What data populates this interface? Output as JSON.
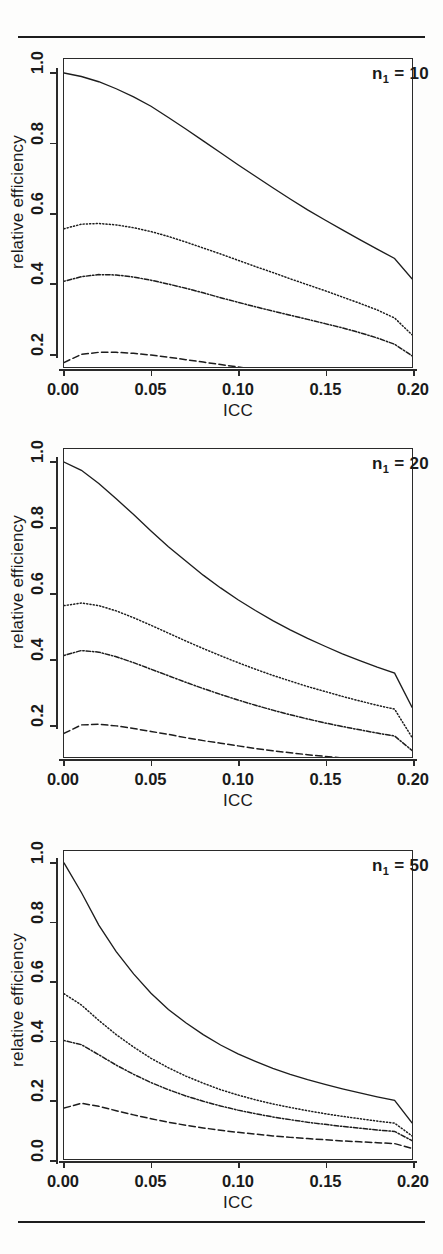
{
  "figure": {
    "background_color": "#fdfdfc",
    "ink_color": "#1d1d1d",
    "top_rule": true,
    "bottom_rule": true
  },
  "chart_data": [
    {
      "type": "line",
      "title": "",
      "panel_label": "n",
      "panel_label_sub": "1",
      "panel_label_value": "= 10",
      "xlabel": "ICC",
      "ylabel": "relative efficiency",
      "xlim": [
        0.0,
        0.2
      ],
      "ylim": [
        0.16,
        1.04
      ],
      "xticks": [
        0.0,
        0.05,
        0.1,
        0.15,
        0.2
      ],
      "xtick_labels": [
        "0.00",
        "0.05",
        "0.10",
        "0.15",
        "0.20"
      ],
      "yticks": [
        0.2,
        0.4,
        0.6,
        0.8,
        1.0
      ],
      "ytick_labels": [
        "0.2",
        "0.4",
        "0.6",
        "0.8",
        "1.0"
      ],
      "grid": false,
      "legend": "none",
      "x": [
        0.0,
        0.01,
        0.02,
        0.03,
        0.04,
        0.05,
        0.06,
        0.07,
        0.08,
        0.09,
        0.1,
        0.11,
        0.12,
        0.13,
        0.14,
        0.15,
        0.16,
        0.17,
        0.18,
        0.19,
        0.2
      ],
      "series": [
        {
          "name": "series-1",
          "style": "solid",
          "values": [
            1.0,
            0.99,
            0.975,
            0.955,
            0.932,
            0.905,
            0.873,
            0.84,
            0.806,
            0.772,
            0.738,
            0.705,
            0.672,
            0.64,
            0.609,
            0.58,
            0.552,
            0.524,
            0.497,
            0.47,
            0.412
          ]
        },
        {
          "name": "series-2",
          "style": "dotted",
          "values": [
            0.555,
            0.568,
            0.57,
            0.566,
            0.558,
            0.547,
            0.533,
            0.517,
            0.5,
            0.483,
            0.465,
            0.447,
            0.43,
            0.412,
            0.395,
            0.378,
            0.36,
            0.342,
            0.323,
            0.3,
            0.252
          ]
        },
        {
          "name": "series-3",
          "style": "dotdash",
          "values": [
            0.405,
            0.418,
            0.424,
            0.423,
            0.417,
            0.408,
            0.397,
            0.385,
            0.372,
            0.358,
            0.345,
            0.332,
            0.32,
            0.308,
            0.296,
            0.284,
            0.272,
            0.258,
            0.243,
            0.225,
            0.192
          ]
        },
        {
          "name": "series-4",
          "style": "dashed",
          "values": [
            0.173,
            0.196,
            0.202,
            0.202,
            0.199,
            0.194,
            0.188,
            0.181,
            0.174,
            0.167,
            0.16,
            0.153,
            0.147,
            0.141,
            0.135,
            0.129,
            0.124,
            0.118,
            0.112,
            0.105,
            0.091
          ]
        }
      ]
    },
    {
      "type": "line",
      "title": "",
      "panel_label": "n",
      "panel_label_sub": "1",
      "panel_label_value": "= 20",
      "xlabel": "ICC",
      "ylabel": "relative efficiency",
      "xlim": [
        0.0,
        0.2
      ],
      "ylim": [
        0.1,
        1.04
      ],
      "xticks": [
        0.0,
        0.05,
        0.1,
        0.15,
        0.2
      ],
      "xtick_labels": [
        "0.00",
        "0.05",
        "0.10",
        "0.15",
        "0.20"
      ],
      "yticks": [
        0.2,
        0.4,
        0.6,
        0.8,
        1.0
      ],
      "ytick_labels": [
        "0.2",
        "0.4",
        "0.6",
        "0.8",
        "1.0"
      ],
      "grid": false,
      "legend": "none",
      "x": [
        0.0,
        0.01,
        0.02,
        0.03,
        0.04,
        0.05,
        0.06,
        0.07,
        0.08,
        0.09,
        0.1,
        0.11,
        0.12,
        0.13,
        0.14,
        0.15,
        0.16,
        0.17,
        0.18,
        0.19,
        0.2
      ],
      "series": [
        {
          "name": "series-1",
          "style": "solid",
          "values": [
            1.0,
            0.975,
            0.935,
            0.888,
            0.84,
            0.79,
            0.742,
            0.698,
            0.655,
            0.616,
            0.58,
            0.547,
            0.516,
            0.488,
            0.462,
            0.438,
            0.415,
            0.394,
            0.374,
            0.356,
            0.252
          ]
        },
        {
          "name": "series-2",
          "style": "dotted",
          "values": [
            0.562,
            0.57,
            0.562,
            0.546,
            0.525,
            0.502,
            0.478,
            0.454,
            0.431,
            0.409,
            0.388,
            0.368,
            0.349,
            0.332,
            0.315,
            0.3,
            0.285,
            0.271,
            0.258,
            0.246,
            0.16
          ]
        },
        {
          "name": "series-3",
          "style": "dotdash",
          "values": [
            0.41,
            0.425,
            0.42,
            0.406,
            0.388,
            0.368,
            0.348,
            0.328,
            0.309,
            0.291,
            0.274,
            0.258,
            0.243,
            0.229,
            0.216,
            0.204,
            0.193,
            0.183,
            0.173,
            0.164,
            0.12
          ]
        },
        {
          "name": "series-4",
          "style": "dashed",
          "values": [
            0.172,
            0.198,
            0.2,
            0.195,
            0.187,
            0.178,
            0.169,
            0.159,
            0.15,
            0.142,
            0.134,
            0.126,
            0.119,
            0.113,
            0.107,
            0.102,
            0.097,
            0.092,
            0.088,
            0.084,
            0.065
          ]
        }
      ]
    },
    {
      "type": "line",
      "title": "",
      "panel_label": "n",
      "panel_label_sub": "1",
      "panel_label_value": "= 50",
      "xlabel": "ICC",
      "ylabel": "relative efficiency",
      "xlim": [
        0.0,
        0.2
      ],
      "ylim": [
        0.0,
        1.04
      ],
      "xticks": [
        0.0,
        0.05,
        0.1,
        0.15,
        0.2
      ],
      "xtick_labels": [
        "0.00",
        "0.05",
        "0.10",
        "0.15",
        "0.20"
      ],
      "yticks": [
        0.0,
        0.2,
        0.4,
        0.6,
        0.8,
        1.0
      ],
      "ytick_labels": [
        "0.0",
        "0.2",
        "0.4",
        "0.6",
        "0.8",
        "1.0"
      ],
      "grid": false,
      "legend": "none",
      "x": [
        0.0,
        0.01,
        0.02,
        0.03,
        0.04,
        0.05,
        0.06,
        0.07,
        0.08,
        0.09,
        0.1,
        0.11,
        0.12,
        0.13,
        0.14,
        0.15,
        0.16,
        0.17,
        0.18,
        0.19,
        0.2
      ],
      "series": [
        {
          "name": "series-1",
          "style": "solid",
          "values": [
            1.0,
            0.9,
            0.79,
            0.7,
            0.625,
            0.56,
            0.505,
            0.46,
            0.42,
            0.385,
            0.355,
            0.33,
            0.306,
            0.286,
            0.268,
            0.252,
            0.237,
            0.223,
            0.21,
            0.198,
            0.122
          ]
        },
        {
          "name": "series-2",
          "style": "dotted",
          "values": [
            0.558,
            0.52,
            0.468,
            0.42,
            0.378,
            0.34,
            0.308,
            0.28,
            0.256,
            0.234,
            0.216,
            0.2,
            0.186,
            0.174,
            0.163,
            0.153,
            0.144,
            0.136,
            0.128,
            0.121,
            0.078
          ]
        },
        {
          "name": "series-3",
          "style": "dotdash",
          "values": [
            0.4,
            0.386,
            0.352,
            0.317,
            0.286,
            0.258,
            0.234,
            0.213,
            0.195,
            0.179,
            0.165,
            0.153,
            0.142,
            0.133,
            0.124,
            0.117,
            0.11,
            0.104,
            0.098,
            0.093,
            0.062
          ]
        },
        {
          "name": "series-4",
          "style": "dashed",
          "values": [
            0.172,
            0.188,
            0.178,
            0.163,
            0.149,
            0.136,
            0.124,
            0.114,
            0.105,
            0.097,
            0.09,
            0.084,
            0.078,
            0.073,
            0.069,
            0.065,
            0.061,
            0.058,
            0.055,
            0.052,
            0.036
          ]
        }
      ]
    }
  ]
}
